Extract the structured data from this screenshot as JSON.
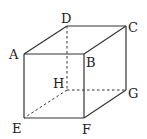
{
  "diagram": {
    "type": "cube",
    "stroke_color": "#333333",
    "vertices": {
      "A": {
        "label": "A",
        "x": 24,
        "y": 54
      },
      "B": {
        "label": "B",
        "x": 84,
        "y": 54
      },
      "C": {
        "label": "C",
        "x": 126,
        "y": 26
      },
      "D": {
        "label": "D",
        "x": 67,
        "y": 26
      },
      "E": {
        "label": "E",
        "x": 24,
        "y": 118
      },
      "F": {
        "label": "F",
        "x": 84,
        "y": 118
      },
      "G": {
        "label": "G",
        "x": 126,
        "y": 90
      },
      "H": {
        "label": "H",
        "x": 67,
        "y": 90
      }
    },
    "solid_edges": [
      "AB",
      "BC",
      "CD",
      "DA",
      "AE",
      "BF",
      "CG",
      "EF",
      "FG"
    ],
    "dashed_edges": [
      "DH",
      "HE",
      "HG"
    ]
  }
}
